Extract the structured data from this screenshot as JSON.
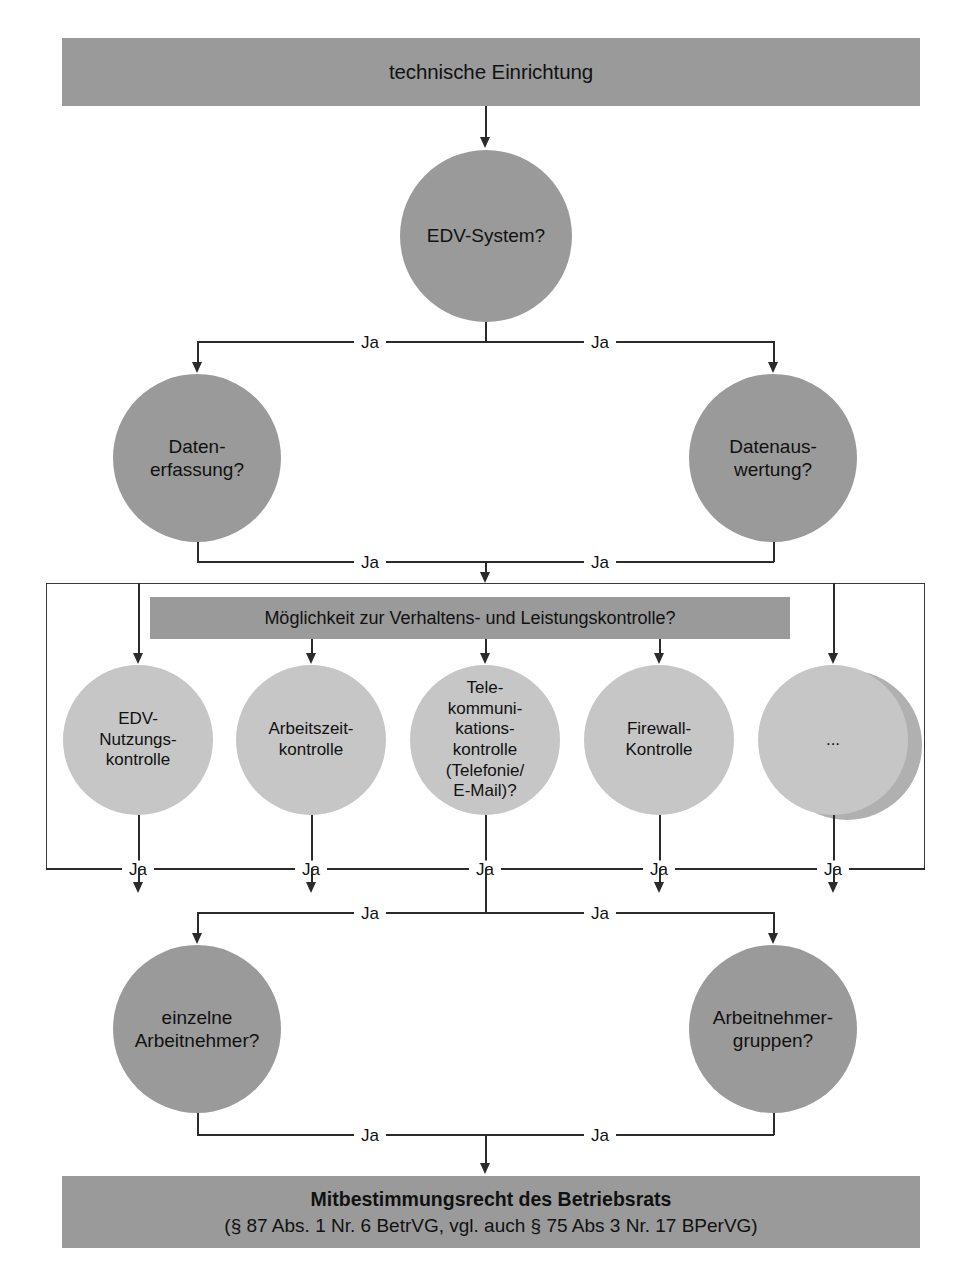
{
  "diagram": {
    "title": "technische Einrichtung",
    "language": "de",
    "edge_label": "Ja"
  },
  "banners": {
    "top": "technische Einrichtung",
    "middle": "Möglichkeit zur Verhaltens- und Leistungskontrolle?",
    "result_line1": "Mitbestimmungsrecht des Betriebsrats",
    "result_line2": "(§ 87 Abs. 1 Nr. 6 BetrVG, vgl. auch § 75 Abs 3 Nr. 17 BPerVG)"
  },
  "nodes": {
    "root": "EDV-System?",
    "row2": [
      "Daten-\nerfassung?",
      "Datenaus-\nwertung?"
    ],
    "controls": [
      "EDV-\nNutzungs-\nkontrolle",
      "Arbeitszeit-\nkontrolle",
      "Tele-\nkommuni-\nkations-\nkontrolle\n(Telefonie/\nE-Mail)?",
      "Firewall-\nKontrolle",
      "..."
    ],
    "row4": [
      "einzelne\nArbeitnehmer?",
      "Arbeitnehmer-\ngruppen?"
    ]
  },
  "edges": {
    "root_left": "Ja",
    "root_right": "Ja",
    "row2_left": "Ja",
    "row2_right": "Ja",
    "controls": [
      "Ja",
      "Ja",
      "Ja",
      "Ja",
      "Ja"
    ],
    "row4_left": "Ja",
    "row4_right": "Ja",
    "result_left": "Ja",
    "result_right": "Ja"
  },
  "colors": {
    "banner_fill": "#9a9a9a",
    "circle_dark": "#9a9a9a",
    "circle_light": "#c6c6c6",
    "line": "#2b2b2b",
    "text": "#111111",
    "background": "#ffffff"
  }
}
